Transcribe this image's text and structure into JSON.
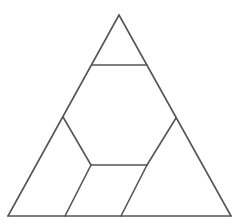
{
  "diagram": {
    "type": "triangle-partition",
    "stroke_color": "#555555",
    "background": "#ffffff",
    "points": {
      "apex": [
        119,
        15
      ],
      "bottom_left": [
        8,
        216
      ],
      "bottom_right": [
        231,
        216
      ],
      "top_cut_left": [
        92,
        65
      ],
      "top_cut_right": [
        147,
        65
      ],
      "left_node": [
        63,
        117
      ],
      "right_node": [
        176,
        118
      ],
      "inner_left": [
        91,
        165
      ],
      "inner_right": [
        147,
        165
      ],
      "bottom_mid_left": [
        65,
        216
      ],
      "bottom_mid_right": [
        121,
        216
      ]
    },
    "segments": [
      {
        "name": "left-edge",
        "from": "apex",
        "to": "bottom_left"
      },
      {
        "name": "right-edge",
        "from": "apex",
        "to": "bottom_right"
      },
      {
        "name": "bottom-edge",
        "from": "bottom_left",
        "to": "bottom_right"
      },
      {
        "name": "top-cut",
        "from": "top_cut_left",
        "to": "top_cut_right"
      },
      {
        "name": "left-node-to-inner-left",
        "from": "left_node",
        "to": "inner_left"
      },
      {
        "name": "inner-horizontal",
        "from": "inner_left",
        "to": "inner_right"
      },
      {
        "name": "inner-left-to-bottom",
        "from": "inner_left",
        "to": "bottom_mid_left"
      },
      {
        "name": "inner-right-to-bottom",
        "from": "inner_right",
        "to": "bottom_mid_right"
      },
      {
        "name": "right-node-to-inner-right",
        "from": "right_node",
        "to": "inner_right"
      }
    ],
    "regions": [
      "top-small-triangle",
      "central-hexagon",
      "bottom-left-quadrilateral",
      "bottom-middle-parallelogram",
      "bottom-right-triangle"
    ]
  }
}
